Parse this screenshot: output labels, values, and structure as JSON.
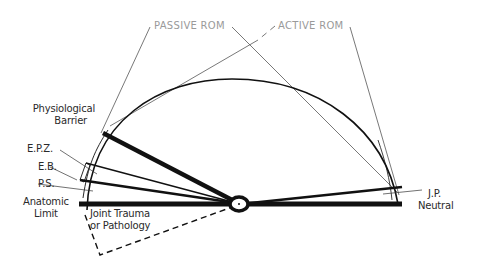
{
  "diagram": {
    "header_labels": {
      "passive_rom": "PASSIVE ROM",
      "active_rom": "ACTIVE ROM"
    },
    "left_labels": {
      "physiological_barrier_line1": "Physiological",
      "physiological_barrier_line2": "Barrier",
      "epz": "E.P.Z.",
      "eb": "E.B.",
      "ps": "P.S.",
      "anatomic_limit_line1": "Anatomic",
      "anatomic_limit_line2": "Limit"
    },
    "inner_labels": {
      "joint_trauma_line1": "Joint Trauma",
      "joint_trauma_line2": "or Pathology"
    },
    "right_labels": {
      "jp_line1": "J.P.",
      "jp_line2": "Neutral"
    },
    "colors": {
      "stroke": "#111111",
      "rom_text": "#9a9a9a",
      "label_text": "#2a2a2a"
    }
  }
}
